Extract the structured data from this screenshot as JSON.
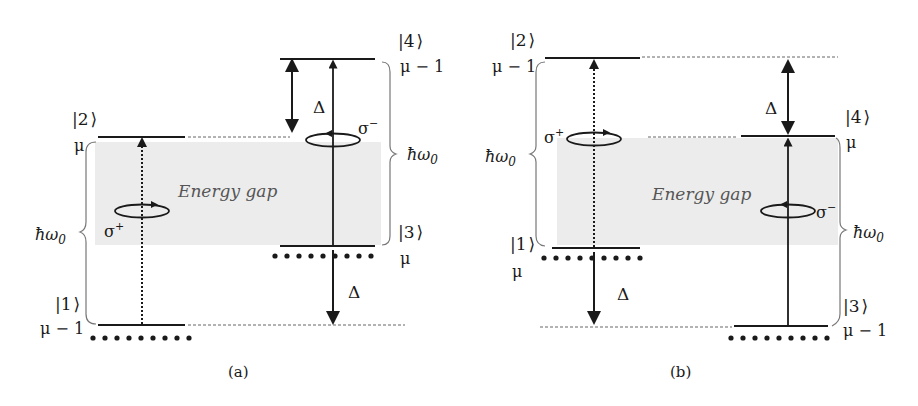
{
  "figure": {
    "panels": [
      {
        "id": "a",
        "caption": "(a)",
        "energy_gap_label": "Energy gap",
        "levels": [
          {
            "state": "|4⟩",
            "ket_num": "4",
            "occupancy": "μ − 1",
            "position": "top-right"
          },
          {
            "state": "|2⟩",
            "ket_num": "2",
            "occupancy": "μ",
            "position": "upper-left"
          },
          {
            "state": "|3⟩",
            "ket_num": "3",
            "occupancy": "μ",
            "position": "lower-right"
          },
          {
            "state": "|1⟩",
            "ket_num": "1",
            "occupancy": "μ − 1",
            "position": "bottom-left"
          }
        ],
        "transitions": [
          {
            "from": "|1⟩",
            "to": "|2⟩",
            "polarization": "σ+",
            "style": "dotted"
          },
          {
            "from": "|3⟩",
            "to": "|4⟩",
            "polarization": "σ−",
            "style": "solid"
          }
        ],
        "detuning_labels": [
          "Δ",
          "Δ"
        ],
        "energy_labels": [
          "ħω0",
          "ħω0"
        ]
      },
      {
        "id": "b",
        "caption": "(b)",
        "energy_gap_label": "Energy gap",
        "levels": [
          {
            "state": "|2⟩",
            "ket_num": "2",
            "occupancy": "μ − 1",
            "position": "top-left"
          },
          {
            "state": "|4⟩",
            "ket_num": "4",
            "occupancy": "μ",
            "position": "upper-right"
          },
          {
            "state": "|1⟩",
            "ket_num": "1",
            "occupancy": "μ",
            "position": "lower-left"
          },
          {
            "state": "|3⟩",
            "ket_num": "3",
            "occupancy": "μ − 1",
            "position": "bottom-right"
          }
        ],
        "transitions": [
          {
            "from": "|1⟩",
            "to": "|2⟩",
            "polarization": "σ+",
            "style": "dotted"
          },
          {
            "from": "|3⟩",
            "to": "|4⟩",
            "polarization": "σ−",
            "style": "solid"
          }
        ],
        "detuning_labels": [
          "Δ",
          "Δ"
        ],
        "energy_labels": [
          "ħω0",
          "ħω0"
        ]
      }
    ],
    "symbols": {
      "mu": "μ",
      "mu_minus_1": "μ − 1",
      "delta": "Δ",
      "hbar_omega": "ħω",
      "omega_sub": "0",
      "sigma": "σ",
      "plus": "+",
      "minus": "−",
      "ket_open": "|",
      "ket_close": "⟩"
    },
    "colors": {
      "line": "#1a1a1a",
      "gap_fill": "#ececec",
      "dashed": "#666666",
      "brace": "#777777"
    }
  }
}
